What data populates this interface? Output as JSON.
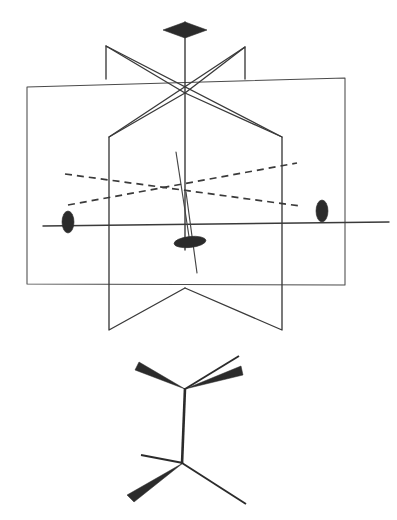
{
  "figure": {
    "background_color": "#ffffff",
    "line_color": "#3a3a3a",
    "bond_color": "#2b2b2b",
    "width": 397,
    "height": 520
  },
  "upper_diagram": {
    "name": "symmetry-element-diagram",
    "description": "Three intersecting vertical mirror planes with a principal rotation axis and three perpendicular two-fold axes",
    "center_point": {
      "x": 185,
      "y": 93
    },
    "lower_center_point": {
      "x": 185,
      "y": 192
    },
    "planes": [
      {
        "id": "plane-back-left",
        "label": "sigma-v-plane-back-left",
        "outline": "106,46 185,93 185,93 106,79 106,79"
      },
      {
        "id": "plane-back-right",
        "label": "sigma-v-plane-back-right",
        "outline": "245,47 185,93 245,79"
      },
      {
        "id": "plane-large-rear",
        "label": "sigma-v-plane-rear-wide",
        "outline": "27,87 345,78 345,285 27,284"
      },
      {
        "id": "plane-front-left",
        "label": "sigma-v-plane-front-left",
        "outline": "185,93 109,137 109,330 185,288"
      },
      {
        "id": "plane-front-right",
        "label": "sigma-v-plane-front-right",
        "outline": "185,93 282,137 282,330 185,288"
      }
    ],
    "axes": [
      {
        "id": "c3-principal-axis",
        "label": "principal-rotation-axis",
        "orientation": "vertical",
        "marker": "arrowhead-lens",
        "from": {
          "x": 185,
          "y": 20
        },
        "to": {
          "x": 185,
          "y": 250
        }
      },
      {
        "id": "c2-axis-horizontal",
        "label": "two-fold-axis-horizontal",
        "orientation": "in-plane-horizontal",
        "marker": "filled-ellipse-vertical",
        "from": {
          "x": 43,
          "y": 222
        },
        "to": {
          "x": 389,
          "y": 222
        }
      },
      {
        "id": "c2-axis-dashed-a",
        "label": "two-fold-axis-dashed-upper-left",
        "orientation": "dashed-receding",
        "from": {
          "x": 66,
          "y": 174
        },
        "to": {
          "x": 300,
          "y": 206
        }
      },
      {
        "id": "c2-axis-dashed-b",
        "label": "two-fold-axis-dashed-lower-left",
        "orientation": "dashed-receding",
        "from": {
          "x": 68,
          "y": 205
        },
        "to": {
          "x": 297,
          "y": 164
        }
      },
      {
        "id": "c2-axis-front",
        "label": "two-fold-axis-front-projecting",
        "orientation": "toward-viewer",
        "marker": "filled-ellipse-horizontal",
        "from": {
          "x": 177,
          "y": 151
        },
        "to": {
          "x": 196,
          "y": 272
        }
      }
    ],
    "markers": [
      {
        "id": "axis-arrowhead-top",
        "name": "c3-axis-arrowhead",
        "shape": "lens",
        "x": 185,
        "y": 29
      },
      {
        "id": "ellipse-left",
        "name": "c2-axis-marker-left",
        "shape": "ellipse-vertical",
        "x": 68,
        "y": 214
      },
      {
        "id": "ellipse-right",
        "name": "c2-axis-marker-right",
        "shape": "ellipse-vertical",
        "x": 322,
        "y": 210
      },
      {
        "id": "ellipse-center",
        "name": "c2-axis-marker-front",
        "shape": "ellipse-horizontal",
        "x": 190,
        "y": 242
      }
    ]
  },
  "lower_diagram": {
    "name": "molecular-structure",
    "description": "Staggered ethane drawn with wedge and plain bonds between two carbon centres",
    "atoms": [
      {
        "id": "c-top",
        "name": "carbon-upper",
        "x": 185,
        "y": 389
      },
      {
        "id": "c-bottom",
        "name": "carbon-lower",
        "x": 182,
        "y": 463
      }
    ],
    "bonds": [
      {
        "id": "bond-c-c",
        "name": "carbon-carbon-bond",
        "type": "plain",
        "from": "c-top",
        "to": "c-bottom"
      },
      {
        "id": "bond-top-left",
        "name": "bond-upper-left-wedge",
        "type": "wedge",
        "tip": {
          "x": 185,
          "y": 389
        },
        "end": {
          "x": 137,
          "y": 366
        },
        "width": 6
      },
      {
        "id": "bond-top-right-thin",
        "name": "bond-upper-right-plain",
        "type": "thin",
        "from": {
          "x": 185,
          "y": 389
        },
        "to": {
          "x": 237,
          "y": 357
        }
      },
      {
        "id": "bond-top-right-wedge",
        "name": "bond-upper-right-wedge",
        "type": "wedge",
        "tip": {
          "x": 185,
          "y": 389
        },
        "end": {
          "x": 240,
          "y": 371
        },
        "width": 7
      },
      {
        "id": "bond-bottom-left-thin",
        "name": "bond-lower-left-plain",
        "type": "thin",
        "from": {
          "x": 182,
          "y": 463
        },
        "to": {
          "x": 142,
          "y": 456
        }
      },
      {
        "id": "bond-bottom-left-wedge",
        "name": "bond-lower-left-wedge",
        "type": "wedge",
        "tip": {
          "x": 182,
          "y": 463
        },
        "end": {
          "x": 131,
          "y": 500
        },
        "width": 7
      },
      {
        "id": "bond-bottom-right",
        "name": "bond-lower-right-plain",
        "type": "thin",
        "from": {
          "x": 182,
          "y": 463
        },
        "to": {
          "x": 245,
          "y": 503
        }
      }
    ]
  }
}
